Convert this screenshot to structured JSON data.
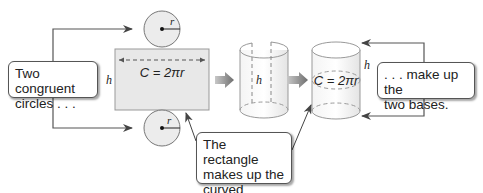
{
  "diagram": {
    "callouts": {
      "circles": "Two congruent circles . . .",
      "circles_line1": "Two congruent",
      "circles_line2": "circles . . .",
      "bases": ". . . make up the two bases.",
      "bases_line1": ". . . make up the",
      "bases_line2": "two bases.",
      "rectangle": "The rectangle makes up the curved surface.",
      "rectangle_line1": "The rectangle",
      "rectangle_line2": "makes up the",
      "rectangle_line3": "curved surface."
    },
    "labels": {
      "radius": "r",
      "height": "h",
      "circumference": "C",
      "circumference_formula": "C = 2πr"
    },
    "colors": {
      "rectangle_fill": "#e8e8e8",
      "circle_fill": "#ececec",
      "stroke": "#555555",
      "arrow_gray": "#8a8a8a"
    }
  }
}
